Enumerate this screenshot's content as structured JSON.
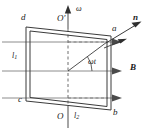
{
  "figure": {
    "colors": {
      "coil": "#3b3b3b",
      "field_line": "#8c8c8c",
      "axis": "#4a4a4a",
      "dashed": "#6e6e6e",
      "label": "#1a1a1a",
      "background": "#ffffff"
    }
  },
  "labels": {
    "vertex_a": "a",
    "vertex_b": "b",
    "vertex_c": "c",
    "vertex_d": "d",
    "axis_top": "O",
    "axis_top_prime": "′",
    "axis_bottom": "O",
    "omega": "ω",
    "normal": "n",
    "field": "B",
    "angle": "ωt",
    "side_l1": "l",
    "side_l1_sub": "1",
    "side_l2": "l",
    "side_l2_sub": "2"
  },
  "geometry": {
    "coil_vertices": {
      "a": [
        111,
        36
      ],
      "b": [
        111,
        110
      ],
      "c": [
        26,
        101
      ],
      "d": [
        26,
        27
      ]
    },
    "rotation_axis": {
      "x": 68,
      "y_top": 10,
      "y_bottom": 128
    },
    "field_lines_y": [
      42,
      71,
      98
    ],
    "field_arrow_x": 118,
    "normal_vector": {
      "from": [
        108,
        41
      ],
      "to": [
        140,
        22
      ]
    },
    "angle_arc_center": [
      68,
      71
    ],
    "angle_value_deg": 27
  }
}
